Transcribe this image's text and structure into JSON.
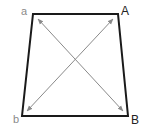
{
  "diagram": {
    "labels": {
      "a": "a",
      "A": "A",
      "b": "b",
      "B": "B"
    },
    "colors": {
      "outline": "#1a1a1a",
      "arrow": "#8a8a8a",
      "label_lower": "#8a8a8a",
      "label_upper": "#222222",
      "background": "#ffffff"
    },
    "shape": "trapezoid",
    "vertices": {
      "a": [
        33,
        14
      ],
      "A": [
        118,
        14
      ],
      "B": [
        128,
        116
      ],
      "b": [
        22,
        116
      ]
    },
    "arrows": [
      {
        "from": "a",
        "to": "B",
        "double_headed": true
      },
      {
        "from": "b",
        "to": "A",
        "double_headed": true
      }
    ]
  }
}
